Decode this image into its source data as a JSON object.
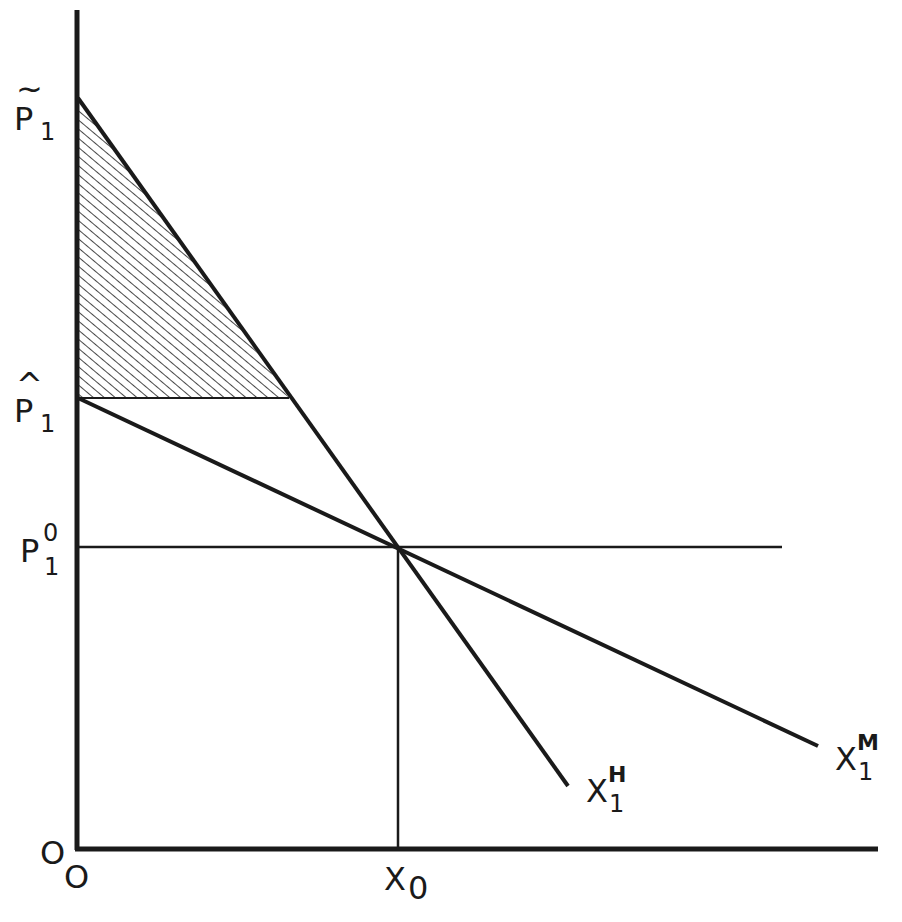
{
  "diagram": {
    "type": "supply-demand / consumer surplus diagram",
    "colors": {
      "ink": "#1a1a1a",
      "background": "#ffffff"
    },
    "y_axis": {
      "labels": [
        {
          "id": "p_tilde",
          "base": "P",
          "accent": "~",
          "subscript": "1"
        },
        {
          "id": "p_hat",
          "base": "P",
          "accent": "^",
          "subscript": "1"
        },
        {
          "id": "p_zero",
          "base": "P",
          "superscript": "0",
          "subscript": "1"
        },
        {
          "id": "origin_y",
          "text": "O"
        }
      ]
    },
    "x_axis": {
      "labels": [
        {
          "id": "origin_x",
          "text": "O"
        },
        {
          "id": "x_zero",
          "base": "X",
          "subscript": "0"
        }
      ]
    },
    "curves": [
      {
        "id": "x1_h",
        "base": "X",
        "subscript": "1",
        "superscript": "H",
        "description": "steep demand curve from P̃1 through (X0, P1^0)"
      },
      {
        "id": "x1_m",
        "base": "X",
        "subscript": "1",
        "superscript": "M",
        "description": "flatter demand curve from P̂1 through (X0, P1^0)"
      }
    ],
    "shaded_region": "triangle between P̃1, P̂1 and the X1^H curve (hatched)",
    "reference_lines": [
      "horizontal line at P1^0",
      "vertical line at X0"
    ]
  }
}
